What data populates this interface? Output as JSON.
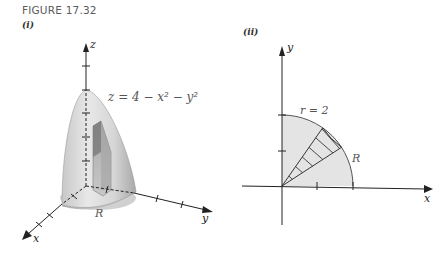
{
  "figure": {
    "title": "FIGURE 17.32",
    "panels": [
      {
        "label": "(i)",
        "axes": {
          "x": "x",
          "y": "y",
          "z": "z"
        },
        "equation": "z = 4 − x² − y²",
        "region_label": "R"
      },
      {
        "label": "(ii)",
        "axes": {
          "x": "x",
          "y": "y"
        },
        "curve_label": "r = 2",
        "region_label": "R"
      }
    ]
  },
  "colors": {
    "axis": "#222222",
    "surface_fill": "#d9d9d9",
    "region_fill": "#e6e6e6",
    "prism_dark": "#8a8a8a",
    "prism_light": "#b5b5b5",
    "label_text": "#555555"
  }
}
